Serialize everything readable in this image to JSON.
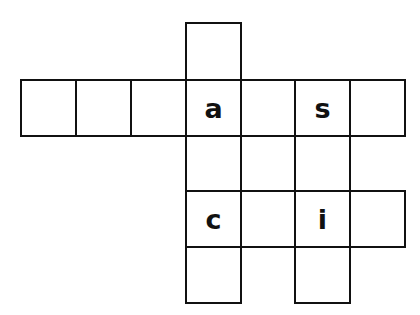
{
  "puzzle": {
    "type": "crossword-grid",
    "cells": [
      {
        "row": 0,
        "col": 3,
        "letter": ""
      },
      {
        "row": 1,
        "col": 0,
        "letter": ""
      },
      {
        "row": 1,
        "col": 1,
        "letter": ""
      },
      {
        "row": 1,
        "col": 2,
        "letter": ""
      },
      {
        "row": 1,
        "col": 3,
        "letter": "a"
      },
      {
        "row": 1,
        "col": 4,
        "letter": ""
      },
      {
        "row": 1,
        "col": 5,
        "letter": "s"
      },
      {
        "row": 1,
        "col": 6,
        "letter": ""
      },
      {
        "row": 2,
        "col": 3,
        "letter": ""
      },
      {
        "row": 2,
        "col": 4,
        "letter": ""
      },
      {
        "row": 2,
        "col": 5,
        "letter": ""
      },
      {
        "row": 3,
        "col": 3,
        "letter": "c"
      },
      {
        "row": 3,
        "col": 4,
        "letter": ""
      },
      {
        "row": 3,
        "col": 5,
        "letter": "i"
      },
      {
        "row": 3,
        "col": 6,
        "letter": ""
      },
      {
        "row": 4,
        "col": 3,
        "letter": ""
      },
      {
        "row": 4,
        "col": 5,
        "letter": ""
      }
    ]
  }
}
